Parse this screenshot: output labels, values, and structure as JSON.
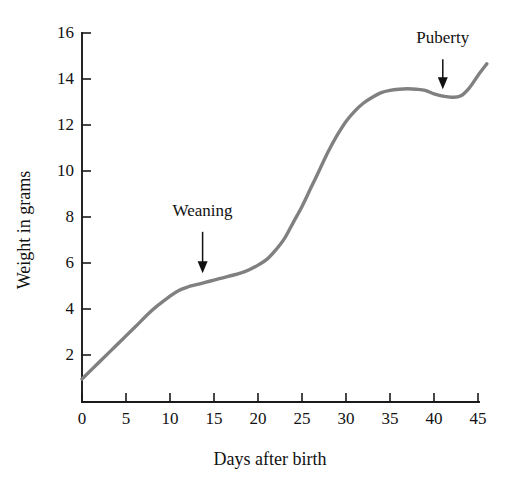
{
  "chart_data": {
    "type": "line",
    "title": "",
    "subtitle": "",
    "xlabel": "Days after birth",
    "ylabel": "Weight in grams",
    "xlim": [
      0,
      46
    ],
    "ylim": [
      0,
      16
    ],
    "grid": false,
    "legend": null,
    "legend_position": "none",
    "line_color": "#808080",
    "axis_color": "#1a1a1a",
    "xticks": [
      0,
      5,
      10,
      15,
      20,
      25,
      30,
      35,
      40,
      45
    ],
    "xtick_labels": [
      "0",
      "5",
      "10",
      "15",
      "20",
      "25",
      "30",
      "35",
      "40",
      "45"
    ],
    "yticks": [
      2,
      4,
      6,
      8,
      10,
      12,
      14,
      16
    ],
    "ytick_labels": [
      "2",
      "4",
      "6",
      "8",
      "10",
      "12",
      "14",
      "16"
    ],
    "series": [
      {
        "name": "Body weight",
        "x": [
          0,
          2,
          4,
          6,
          8,
          10,
          11,
          12,
          13,
          14,
          15,
          16,
          17,
          18,
          19,
          20,
          21,
          22,
          23,
          24,
          25,
          26,
          27,
          28,
          29,
          30,
          31,
          32,
          33,
          34,
          35,
          36,
          37,
          38,
          39,
          40,
          41,
          42,
          43,
          44,
          45,
          46
        ],
        "y": [
          1.0,
          1.75,
          2.5,
          3.25,
          4.0,
          4.6,
          4.85,
          5.0,
          5.1,
          5.2,
          5.3,
          5.4,
          5.5,
          5.6,
          5.75,
          5.95,
          6.2,
          6.6,
          7.1,
          7.8,
          8.5,
          9.3,
          10.1,
          10.9,
          11.6,
          12.2,
          12.65,
          13.0,
          13.25,
          13.45,
          13.55,
          13.6,
          13.62,
          13.6,
          13.55,
          13.4,
          13.3,
          13.25,
          13.3,
          13.65,
          14.2,
          14.7
        ]
      }
    ],
    "annotations": [
      {
        "label": "Weaning",
        "x": 13.7,
        "y_label": 8.1,
        "arrow_from_y": 7.4,
        "arrow_to_y": 5.6
      },
      {
        "label": "Puberty",
        "x": 41.0,
        "y_label": 15.6,
        "arrow_from_y": 14.9,
        "arrow_to_y": 13.6
      }
    ]
  }
}
